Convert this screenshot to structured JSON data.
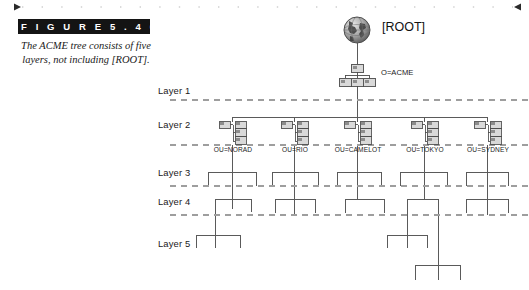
{
  "figure": {
    "banner_label": "F I G U R E   5 . 4 6",
    "caption": "The ACME tree consists of five layers, not including [ROOT]."
  },
  "diagram": {
    "root": {
      "icon": "globe-icon",
      "label": "[ROOT]"
    },
    "organization": {
      "icon": "organization-tree-icon",
      "label": "O=ACME"
    },
    "layers": [
      {
        "label": "Layer 1"
      },
      {
        "label": "Layer 2"
      },
      {
        "label": "Layer 3"
      },
      {
        "label": "Layer 4"
      },
      {
        "label": "Layer 5"
      }
    ],
    "org_units": [
      {
        "icon": "ou-container-icon",
        "label": "OU=NORAD"
      },
      {
        "icon": "ou-container-icon",
        "label": "OU=RIO"
      },
      {
        "icon": "ou-container-icon",
        "label": "OU=CAMELOT"
      },
      {
        "icon": "ou-container-icon",
        "label": "OU=TOKYO"
      },
      {
        "icon": "ou-container-icon",
        "label": "OU=SYDNEY"
      }
    ],
    "colors": {
      "banner_background": "#141414",
      "banner_text": "#ffffff",
      "line": "#5a5a5a",
      "divider": "#9a9a9a",
      "node_fill": "#d9d9d9",
      "node_stroke": "#4a4a4a",
      "page_background": "#ffffff"
    }
  }
}
